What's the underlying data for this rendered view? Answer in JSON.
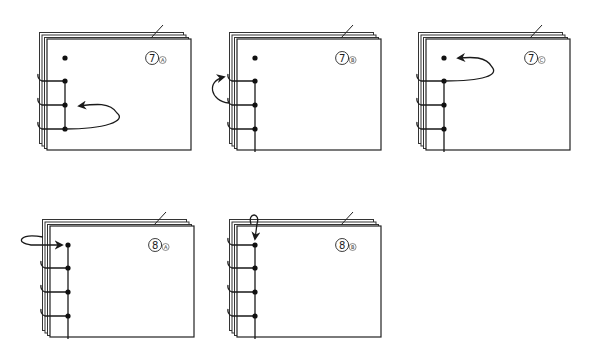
{
  "panels": [
    {
      "id": "7a",
      "step": "7",
      "substep": "A",
      "arrow": "loop-right-to-hole-2",
      "holes": 4,
      "stitched_segments": [
        "1-2",
        "2-3"
      ],
      "wraps": [
        1,
        2,
        3
      ],
      "active_hole": 3
    },
    {
      "id": "7b",
      "step": "7",
      "substep": "B",
      "arrow": "wrap-around-spine-to-hole-1",
      "holes": 4,
      "stitched_segments": [
        "1-2",
        "2-3",
        "3-bottom"
      ],
      "wraps": [
        1,
        2,
        3
      ],
      "active_hole": 1
    },
    {
      "id": "7c",
      "step": "7",
      "substep": "C",
      "arrow": "loop-right-to-top-hole",
      "holes": 4,
      "stitched_segments": [
        "1-2",
        "2-3",
        "3-bottom"
      ],
      "wraps": [
        1,
        2,
        3
      ],
      "active_hole": 1
    },
    {
      "id": "8a",
      "step": "8",
      "substep": "A",
      "arrow": "wrap-around-spine-to-top-hole",
      "holes": 4,
      "stitched_segments": [
        "0-1",
        "1-2",
        "2-3",
        "3-bottom"
      ],
      "wraps": [
        1,
        2,
        3
      ],
      "active_hole": 0
    },
    {
      "id": "8b",
      "step": "8",
      "substep": "B",
      "arrow": "wrap-over-top-edge-to-top-hole",
      "holes": 4,
      "stitched_segments": [
        "0-1",
        "1-2",
        "2-3",
        "3-bottom"
      ],
      "wraps": [
        0,
        1,
        2,
        3
      ],
      "active_hole": 0
    }
  ]
}
